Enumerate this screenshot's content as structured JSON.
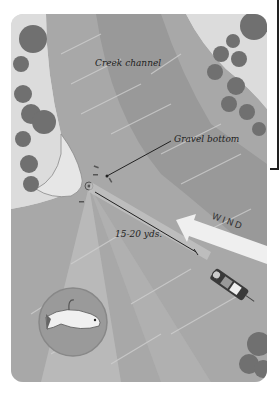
{
  "diagram": {
    "labels": {
      "creek_channel": "Creek channel",
      "gravel_bottom": "Gravel bottom",
      "distance": "15-20 yds.",
      "wind": "WIND"
    },
    "elements": [
      {
        "name": "creek-channel",
        "type": "water"
      },
      {
        "name": "gravel-bottom",
        "type": "substrate"
      },
      {
        "name": "trees",
        "type": "shoreline-vegetation"
      },
      {
        "name": "boat",
        "type": "vessel"
      },
      {
        "name": "cast-line",
        "type": "line"
      },
      {
        "name": "wind-arrow",
        "type": "arrow",
        "direction": "upper-left"
      },
      {
        "name": "lure-inset",
        "type": "circle-inset",
        "content": "swimbait lure"
      }
    ],
    "colors": {
      "land": "#d9d9d9",
      "water": "#a6a6a6",
      "channel": "#999999",
      "tree": "#6f6f6f",
      "inset": "#9a9a9a"
    }
  }
}
